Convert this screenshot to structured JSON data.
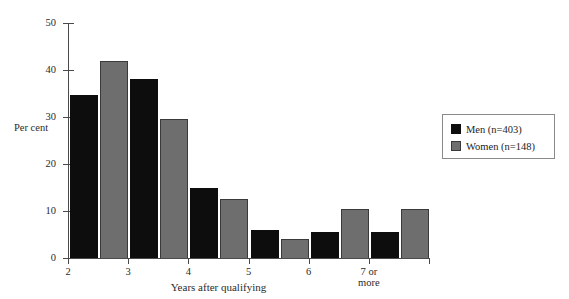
{
  "chart_data": {
    "type": "bar",
    "title": "",
    "subtitle": "",
    "xlabel": "Years after qualifying",
    "ylabel": "Per cent",
    "categories": [
      "2",
      "3",
      "4",
      "5",
      "6",
      "7 or\nmore"
    ],
    "series": [
      {
        "name": "Men (n=403)",
        "color": "#0d0d0d",
        "values": [
          34.7,
          38.0,
          15.0,
          6.0,
          5.5,
          5.5
        ]
      },
      {
        "name": "Women (n=148)",
        "color": "#6e6e6e",
        "values": [
          42.0,
          29.5,
          12.5,
          4.0,
          10.5,
          10.5
        ]
      }
    ],
    "ylim": [
      0,
      50
    ],
    "yticks": [
      0,
      10,
      20,
      30,
      40,
      50
    ],
    "ytick_labels": [
      "0",
      "10",
      "20",
      "30",
      "40",
      "50"
    ],
    "xtick_labels": [
      "2",
      "3",
      "4",
      "5",
      "6",
      "7 or\nmore"
    ],
    "grid": false,
    "legend_position": "right"
  },
  "legend": {
    "entries": [
      {
        "label": "Men (n=403)",
        "color": "#0d0d0d"
      },
      {
        "label": "Women (n=148)",
        "color": "#6e6e6e"
      }
    ]
  },
  "colors": {
    "men": "#0d0d0d",
    "women": "#6e6e6e",
    "axis": "#4a4a4a",
    "background": "#ffffff",
    "legend_border": "#8a8a8a"
  }
}
